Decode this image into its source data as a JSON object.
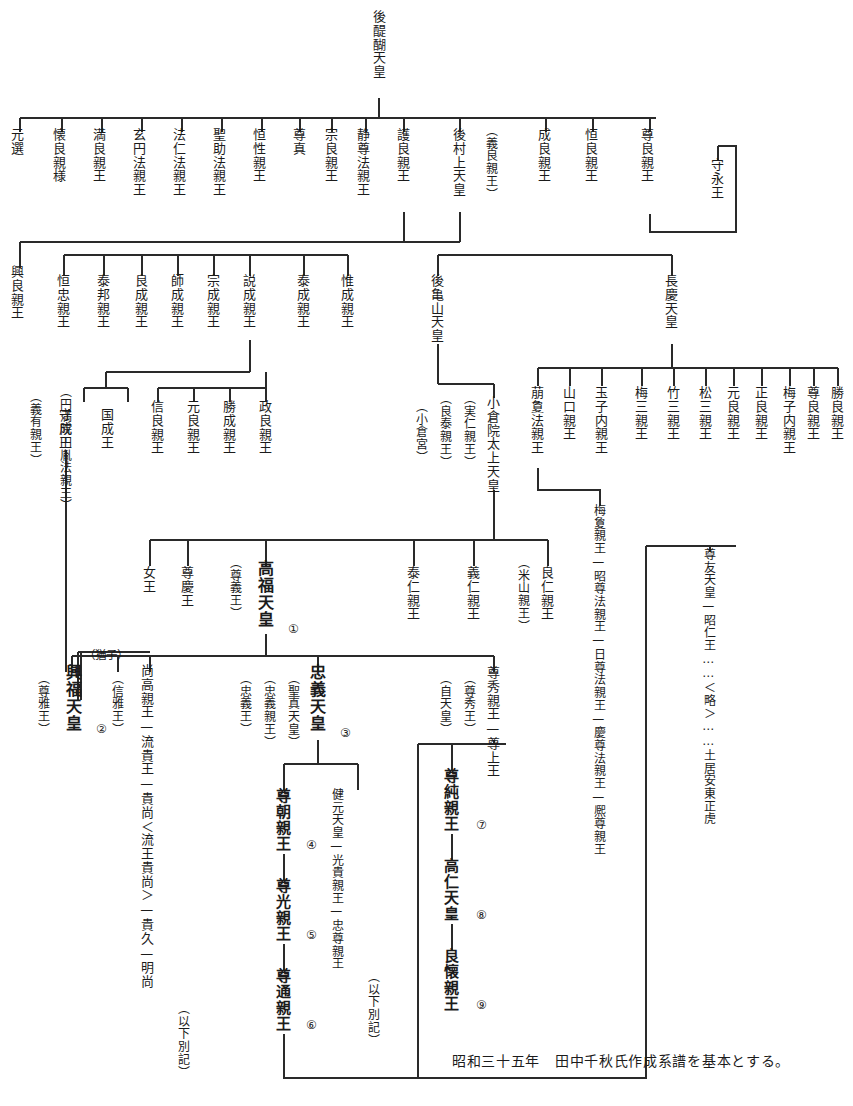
{
  "document": {
    "title": "後醍醐天皇系譜図",
    "footnote": "昭和三十五年　田中千秋氏作成系譜を基本とする。",
    "ink_color": "#1b1b1b",
    "background_color": "#ffffff"
  },
  "generations": {
    "g0": {
      "label": "初代",
      "nodes": [
        {
          "id": "godaigo",
          "text": "後醍醐天皇",
          "x": 372,
          "y": 10,
          "bold": false
        }
      ]
    },
    "g1": {
      "label": "第二世代",
      "nodes": [
        {
          "id": "motonobu",
          "text": "元選",
          "x": 10,
          "y": 128
        },
        {
          "id": "kanenaga",
          "text": "懐良親様",
          "x": 52,
          "y": 128
        },
        {
          "id": "mitsunaga",
          "text": "満良親王",
          "x": 92,
          "y": 128
        },
        {
          "id": "genen",
          "text": "玄円法親王",
          "x": 132,
          "y": 128
        },
        {
          "id": "honin",
          "text": "法仁法親王",
          "x": 172,
          "y": 128
        },
        {
          "id": "shojo",
          "text": "聖助法親王",
          "x": 212,
          "y": 128
        },
        {
          "id": "kosho",
          "text": "恒性親王",
          "x": 252,
          "y": 128
        },
        {
          "id": "sonshin",
          "text": "尊真",
          "x": 292,
          "y": 128
        },
        {
          "id": "munenaga",
          "text": "宗良親王",
          "x": 324,
          "y": 128
        },
        {
          "id": "jōson",
          "text": "静尊法親王",
          "x": 356,
          "y": 128
        },
        {
          "id": "morinaga",
          "text": "護良親王",
          "x": 396,
          "y": 128
        },
        {
          "id": "gomurakami",
          "text": "後村上天皇",
          "x": 452,
          "y": 128
        },
        {
          "id": "norinaga",
          "text": "（義良親王）",
          "x": 484,
          "y": 124
        },
        {
          "id": "narinaga",
          "text": "成良親王",
          "x": 537,
          "y": 128
        },
        {
          "id": "tsunenaga",
          "text": "恒良親王",
          "x": 584,
          "y": 128
        },
        {
          "id": "takanaga",
          "text": "尊良親王",
          "x": 640,
          "y": 128
        },
        {
          "id": "morinaga_o",
          "text": "守永王",
          "x": 710,
          "y": 155
        }
      ]
    },
    "g2": {
      "label": "第三世代",
      "nodes": [
        {
          "id": "okinaga",
          "text": "興良親王",
          "x": 10,
          "y": 265
        },
        {
          "id": "tsunetada",
          "text": "恒忠親王",
          "x": 56,
          "y": 272
        },
        {
          "id": "yasukuni",
          "text": "泰邦親王",
          "x": 96,
          "y": 272
        },
        {
          "id": "yoshinari",
          "text": "良成親王",
          "x": 134,
          "y": 272
        },
        {
          "id": "moronari",
          "text": "師成親王",
          "x": 170,
          "y": 272
        },
        {
          "id": "munenari",
          "text": "宗成親王",
          "x": 206,
          "y": 272
        },
        {
          "id": "tokinari",
          "text": "説成親王",
          "x": 242,
          "y": 272
        },
        {
          "id": "yasunari",
          "text": "泰成親王",
          "x": 296,
          "y": 272
        },
        {
          "id": "korenari",
          "text": "惟成親王",
          "x": 340,
          "y": 272
        },
        {
          "id": "gokameyama",
          "text": "後亀山天皇",
          "x": 430,
          "y": 272
        },
        {
          "id": "chokei",
          "text": "長慶天皇",
          "x": 664,
          "y": 272
        }
      ]
    },
    "g3": {
      "label": "第四世代",
      "nodes": [
        {
          "id": "giyu",
          "text": "（義有親王）",
          "x": 28,
          "y": 390
        },
        {
          "id": "enmanin",
          "text": "（円満院円胤法親王）",
          "x": 58,
          "y": 385
        },
        {
          "id": "morinari_o",
          "text": "守成王",
          "x": 58,
          "y": 408
        },
        {
          "id": "kuninari_o",
          "text": "国成王",
          "x": 100,
          "y": 408
        },
        {
          "id": "nobuyoshi",
          "text": "信良親王",
          "x": 150,
          "y": 398
        },
        {
          "id": "motoyoshi",
          "text": "元良親王",
          "x": 186,
          "y": 398
        },
        {
          "id": "katsunari",
          "text": "勝成親王",
          "x": 222,
          "y": 398
        },
        {
          "id": "masayoshi",
          "text": "政良親王",
          "x": 258,
          "y": 398
        },
        {
          "id": "ogura_miya",
          "text": "（小倉宮）",
          "x": 414,
          "y": 395
        },
        {
          "id": "yoshiyasu",
          "text": "（良泰親王）",
          "x": 438,
          "y": 388
        },
        {
          "id": "sanehito",
          "text": "（実仁親王）",
          "x": 462,
          "y": 388
        },
        {
          "id": "ogurain",
          "text": "小倉院太上天皇",
          "x": 486,
          "y": 392
        },
        {
          "id": "hōkei_ho",
          "text": "萠夐法親王",
          "x": 530,
          "y": 382
        },
        {
          "id": "yamaguchi",
          "text": "山口親王",
          "x": 562,
          "y": 382
        },
        {
          "id": "tamako",
          "text": "玉子内親王",
          "x": 594,
          "y": 382
        },
        {
          "id": "umezo",
          "text": "梅三親王",
          "x": 634,
          "y": 382
        },
        {
          "id": "takezo",
          "text": "竹三親王",
          "x": 666,
          "y": 382
        },
        {
          "id": "matsuzo",
          "text": "松三親王",
          "x": 698,
          "y": 382
        },
        {
          "id": "motoyoshi2",
          "text": "元良親王",
          "x": 726,
          "y": 382
        },
        {
          "id": "masayoshi2",
          "text": "正良親王",
          "x": 754,
          "y": 382
        },
        {
          "id": "umeko",
          "text": "梅子内親王",
          "x": 782,
          "y": 382
        },
        {
          "id": "takayoshi",
          "text": "尊良親王",
          "x": 806,
          "y": 382
        },
        {
          "id": "katsuyoshi",
          "text": "勝良親王",
          "x": 830,
          "y": 382
        }
      ]
    },
    "g4": {
      "label": "第五世代",
      "nodes": [
        {
          "id": "joo",
          "text": "女王",
          "x": 142,
          "y": 562
        },
        {
          "id": "sonkei_o",
          "text": "尊慶王",
          "x": 180,
          "y": 562
        },
        {
          "id": "songi_o",
          "text": "（尊義王）",
          "x": 228,
          "y": 554
        },
        {
          "id": "kofuku",
          "text": "高福天皇",
          "x": 258,
          "y": 558,
          "bold": true,
          "marker": "①",
          "marker_x": 288,
          "marker_y": 625
        },
        {
          "id": "yasuhito",
          "text": "泰仁親王",
          "x": 406,
          "y": 562
        },
        {
          "id": "yoshihito",
          "text": "義仁親王",
          "x": 466,
          "y": 562
        },
        {
          "id": "yoneyama",
          "text": "（米山親王）",
          "x": 516,
          "y": 554
        },
        {
          "id": "yoshihito2",
          "text": "良仁親王",
          "x": 540,
          "y": 562
        }
      ]
    },
    "g5": {
      "label": "第六世代",
      "nodes": [
        {
          "id": "sonmasa",
          "text": "（尊雅王）",
          "x": 36,
          "y": 668
        },
        {
          "id": "kofuku_ten",
          "text": "興福天皇",
          "x": 66,
          "y": 662,
          "bold": true,
          "marker": "②",
          "marker_x": 96,
          "marker_y": 725
        },
        {
          "id": "yushi_note",
          "text": "（猶子）",
          "x": 78,
          "y": 648
        },
        {
          "id": "nobumasa",
          "text": "（信雅王）",
          "x": 110,
          "y": 668
        },
        {
          "id": "naotaka",
          "text": "尚高親王—流貴王—貴尚＜流王貴尚＞—貴久—明尚",
          "x": 142,
          "y": 662
        },
        {
          "id": "naotaka_note",
          "text": "（以下別記）",
          "x": 176,
          "y": 1000
        },
        {
          "id": "tadayoshi_o",
          "text": "（忠義王）",
          "x": 238,
          "y": 668
        },
        {
          "id": "tadayoshi_s",
          "text": "（忠義親王）",
          "x": 262,
          "y": 668
        },
        {
          "id": "seishin",
          "text": "（聖真天皇）",
          "x": 286,
          "y": 668
        },
        {
          "id": "tadayoshi",
          "text": "忠義天皇",
          "x": 310,
          "y": 662,
          "bold": true,
          "marker": "③",
          "marker_x": 340,
          "marker_y": 728
        },
        {
          "id": "jitenno",
          "text": "（自天皇）",
          "x": 438,
          "y": 668
        },
        {
          "id": "sonshu_o",
          "text": "（尊秀王）",
          "x": 462,
          "y": 668
        },
        {
          "id": "sonshu",
          "text": "尊秀親王—尊上王",
          "x": 486,
          "y": 662
        }
      ]
    },
    "g6": {
      "label": "第七世代",
      "nodes": [
        {
          "id": "sontomo",
          "text": "尊朝親王",
          "x": 276,
          "y": 786,
          "bold": true,
          "marker": "④",
          "marker_x": 306,
          "marker_y": 838
        },
        {
          "id": "sonko",
          "text": "尊光親王",
          "x": 276,
          "y": 876,
          "bold": true,
          "marker": "⑤",
          "marker_x": 306,
          "marker_y": 928
        },
        {
          "id": "sontsu",
          "text": "尊通親王",
          "x": 276,
          "y": 966,
          "bold": true,
          "marker": "⑥",
          "marker_x": 306,
          "marker_y": 1018
        },
        {
          "id": "kengen",
          "text": "健元天皇—光貴親王—忠尊親王",
          "x": 330,
          "y": 786
        },
        {
          "id": "kengen_note",
          "text": "（以下別記）",
          "x": 366,
          "y": 968
        },
        {
          "id": "sonjun",
          "text": "尊純親王",
          "x": 444,
          "y": 766,
          "bold": true,
          "marker": "⑦",
          "marker_x": 476,
          "marker_y": 818
        },
        {
          "id": "takahito",
          "text": "高仁天皇",
          "x": 444,
          "y": 856,
          "bold": true,
          "marker": "⑧",
          "marker_x": 476,
          "marker_y": 908
        },
        {
          "id": "yoshikane",
          "text": "良懐親王",
          "x": 444,
          "y": 946,
          "bold": true,
          "marker": "⑨",
          "marker_x": 476,
          "marker_y": 998
        }
      ]
    },
    "side_chains": {
      "label": "傍系",
      "nodes": [
        {
          "id": "baikei_chain",
          "text": "梅夐親王—昭尊法親王—日尊法親王—慶尊法親王—熈尊親王",
          "x": 592,
          "y": 502
        },
        {
          "id": "sontomo_chain",
          "text": "尊友天皇—昭仁王……＜略＞……土居安東正虎",
          "x": 702,
          "y": 546
        }
      ]
    }
  },
  "connectors": {
    "label": "系図線",
    "stroke": "#2a2a2a",
    "width": 1
  }
}
